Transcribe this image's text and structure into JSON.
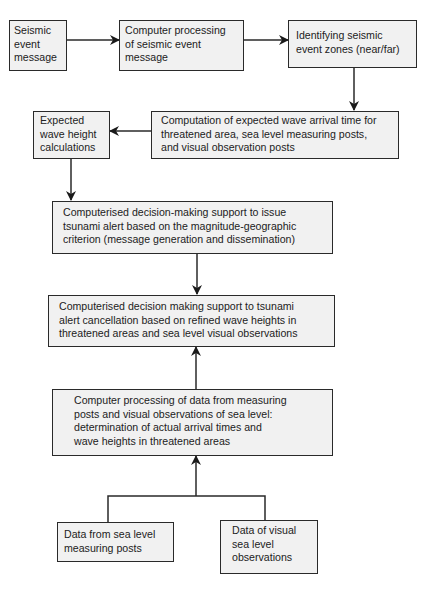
{
  "diagram": {
    "type": "flowchart",
    "nodes": [
      {
        "id": "seismic_event_message",
        "label": "Seismic event message"
      },
      {
        "id": "computer_processing_seismic",
        "label": "Computer processing of seismic event message"
      },
      {
        "id": "identifying_zones",
        "label": "Identifying seismic event zones (near/far)"
      },
      {
        "id": "expected_wave_height",
        "label": "Expected wave height calculations"
      },
      {
        "id": "computation_arrival_time",
        "label": "Computation of expected wave arrival time for threatened area, sea level measuring posts, and visual observation posts"
      },
      {
        "id": "issue_alert",
        "label": "Computerised decision-making support to issue tsunami alert based on the magnitude-geographic criterion (message generation and dissemination)"
      },
      {
        "id": "alert_cancellation",
        "label": "Computerised decision making support to tsunami alert cancellation based on refined wave heights in threatened areas and sea level visual observations"
      },
      {
        "id": "processing_measuring_data",
        "label": "Computer processing of data from measuring posts and visual observations of sea level: determination of actual arrival times and wave heights in threatened areas"
      },
      {
        "id": "sea_level_posts_data",
        "label": "Data from sea level measuring posts"
      },
      {
        "id": "visual_observations_data",
        "label": "Data of visual sea level observations"
      }
    ],
    "edges": [
      {
        "from": "seismic_event_message",
        "to": "computer_processing_seismic"
      },
      {
        "from": "computer_processing_seismic",
        "to": "identifying_zones"
      },
      {
        "from": "identifying_zones",
        "to": "computation_arrival_time"
      },
      {
        "from": "computation_arrival_time",
        "to": "expected_wave_height"
      },
      {
        "from": "expected_wave_height",
        "to": "issue_alert"
      },
      {
        "from": "issue_alert",
        "to": "alert_cancellation"
      },
      {
        "from": "processing_measuring_data",
        "to": "alert_cancellation"
      },
      {
        "from": "sea_level_posts_data",
        "to": "processing_measuring_data"
      },
      {
        "from": "visual_observations_data",
        "to": "processing_measuring_data"
      }
    ]
  },
  "boxes": {
    "b1": [
      "Seismic",
      "event",
      "message"
    ],
    "b2": [
      "Computer processing",
      "of seismic event",
      "message"
    ],
    "b3": [
      "Identifying seismic",
      "event zones (near/far)"
    ],
    "b4": [
      "Expected",
      "wave height",
      "calculations"
    ],
    "b5": [
      "Computation of expected wave arrival time for",
      "threatened area, sea level measuring posts,",
      "and visual observation posts"
    ],
    "b6": [
      "Computerised decision-making support to issue",
      "tsunami alert based on the magnitude-geographic",
      "criterion (message generation and dissemination)"
    ],
    "b7": [
      "Computerised decision making support to tsunami",
      "alert cancellation based on refined wave heights in",
      "threatened areas and sea level visual observations"
    ],
    "b8": [
      "Computer processing of data from measuring",
      "posts and visual observations of sea level:",
      "determination of actual arrival times and",
      "wave heights in threatened areas"
    ],
    "b9": [
      "Data from sea level",
      "measuring posts"
    ],
    "b10": [
      "Data of visual",
      "sea level",
      "observations"
    ]
  },
  "colors": {
    "box_fill": "#f1f1f1",
    "stroke": "#2a2a2a",
    "background": "#ffffff"
  }
}
